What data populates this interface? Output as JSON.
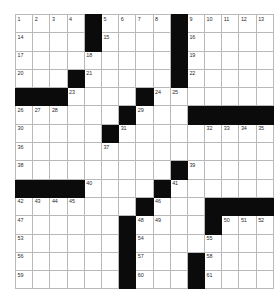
{
  "puzzle": {
    "title": "Crossword Grid",
    "rows": 15,
    "cols": 15,
    "colors": {
      "block": "#0b0b0b",
      "cell": "#ffffff",
      "grid_line": "#b9b9b9",
      "number": "#2a2a2a",
      "background": "#ffffff"
    },
    "grid": [
      [
        {
          "type": "cell",
          "number": "1"
        },
        {
          "type": "cell",
          "number": "2"
        },
        {
          "type": "cell",
          "number": "3"
        },
        {
          "type": "cell",
          "number": "4"
        },
        {
          "type": "block",
          "number": ""
        },
        {
          "type": "cell",
          "number": "5"
        },
        {
          "type": "cell",
          "number": "6"
        },
        {
          "type": "cell",
          "number": "7"
        },
        {
          "type": "cell",
          "number": "8"
        },
        {
          "type": "block",
          "number": ""
        },
        {
          "type": "cell",
          "number": "9"
        },
        {
          "type": "cell",
          "number": "10"
        },
        {
          "type": "cell",
          "number": "11"
        },
        {
          "type": "cell",
          "number": "12"
        },
        {
          "type": "cell",
          "number": "13"
        }
      ],
      [
        {
          "type": "cell",
          "number": "14"
        },
        {
          "type": "cell",
          "number": ""
        },
        {
          "type": "cell",
          "number": ""
        },
        {
          "type": "cell",
          "number": ""
        },
        {
          "type": "block",
          "number": ""
        },
        {
          "type": "cell",
          "number": "15"
        },
        {
          "type": "cell",
          "number": ""
        },
        {
          "type": "cell",
          "number": ""
        },
        {
          "type": "cell",
          "number": ""
        },
        {
          "type": "block",
          "number": ""
        },
        {
          "type": "cell",
          "number": "16"
        },
        {
          "type": "cell",
          "number": ""
        },
        {
          "type": "cell",
          "number": ""
        },
        {
          "type": "cell",
          "number": ""
        },
        {
          "type": "cell",
          "number": ""
        }
      ],
      [
        {
          "type": "cell",
          "number": "17"
        },
        {
          "type": "cell",
          "number": ""
        },
        {
          "type": "cell",
          "number": ""
        },
        {
          "type": "cell",
          "number": ""
        },
        {
          "type": "cell",
          "number": "18"
        },
        {
          "type": "cell",
          "number": ""
        },
        {
          "type": "cell",
          "number": ""
        },
        {
          "type": "cell",
          "number": ""
        },
        {
          "type": "cell",
          "number": ""
        },
        {
          "type": "block",
          "number": ""
        },
        {
          "type": "cell",
          "number": "19"
        },
        {
          "type": "cell",
          "number": ""
        },
        {
          "type": "cell",
          "number": ""
        },
        {
          "type": "cell",
          "number": ""
        },
        {
          "type": "cell",
          "number": ""
        }
      ],
      [
        {
          "type": "cell",
          "number": "20"
        },
        {
          "type": "cell",
          "number": ""
        },
        {
          "type": "cell",
          "number": ""
        },
        {
          "type": "block",
          "number": ""
        },
        {
          "type": "cell",
          "number": "21"
        },
        {
          "type": "cell",
          "number": ""
        },
        {
          "type": "cell",
          "number": ""
        },
        {
          "type": "cell",
          "number": ""
        },
        {
          "type": "cell",
          "number": ""
        },
        {
          "type": "block",
          "number": ""
        },
        {
          "type": "cell",
          "number": "22"
        },
        {
          "type": "cell",
          "number": ""
        },
        {
          "type": "cell",
          "number": ""
        },
        {
          "type": "cell",
          "number": ""
        },
        {
          "type": "cell",
          "number": ""
        }
      ],
      [
        {
          "type": "block",
          "number": ""
        },
        {
          "type": "block",
          "number": ""
        },
        {
          "type": "block",
          "number": ""
        },
        {
          "type": "cell",
          "number": "23"
        },
        {
          "type": "cell",
          "number": ""
        },
        {
          "type": "cell",
          "number": ""
        },
        {
          "type": "cell",
          "number": ""
        },
        {
          "type": "block",
          "number": ""
        },
        {
          "type": "cell",
          "number": "24"
        },
        {
          "type": "cell",
          "number": "25"
        },
        {
          "type": "cell",
          "number": ""
        },
        {
          "type": "cell",
          "number": ""
        },
        {
          "type": "cell",
          "number": ""
        },
        {
          "type": "cell",
          "number": ""
        },
        {
          "type": "cell",
          "number": ""
        }
      ],
      [
        {
          "type": "cell",
          "number": "26"
        },
        {
          "type": "cell",
          "number": "27"
        },
        {
          "type": "cell",
          "number": "28"
        },
        {
          "type": "cell",
          "number": ""
        },
        {
          "type": "cell",
          "number": ""
        },
        {
          "type": "cell",
          "number": ""
        },
        {
          "type": "block",
          "number": ""
        },
        {
          "type": "cell",
          "number": "29"
        },
        {
          "type": "cell",
          "number": ""
        },
        {
          "type": "cell",
          "number": ""
        },
        {
          "type": "block",
          "number": ""
        },
        {
          "type": "block",
          "number": ""
        },
        {
          "type": "block",
          "number": ""
        },
        {
          "type": "block",
          "number": ""
        },
        {
          "type": "block",
          "number": ""
        }
      ],
      [
        {
          "type": "cell",
          "number": "30"
        },
        {
          "type": "cell",
          "number": ""
        },
        {
          "type": "cell",
          "number": ""
        },
        {
          "type": "cell",
          "number": ""
        },
        {
          "type": "cell",
          "number": ""
        },
        {
          "type": "block",
          "number": ""
        },
        {
          "type": "cell",
          "number": "31"
        },
        {
          "type": "cell",
          "number": ""
        },
        {
          "type": "cell",
          "number": ""
        },
        {
          "type": "cell",
          "number": ""
        },
        {
          "type": "cell",
          "number": ""
        },
        {
          "type": "cell",
          "number": "32"
        },
        {
          "type": "cell",
          "number": "33"
        },
        {
          "type": "cell",
          "number": "34"
        },
        {
          "type": "cell",
          "number": "35"
        }
      ],
      [
        {
          "type": "cell",
          "number": "36"
        },
        {
          "type": "cell",
          "number": ""
        },
        {
          "type": "cell",
          "number": ""
        },
        {
          "type": "cell",
          "number": ""
        },
        {
          "type": "cell",
          "number": ""
        },
        {
          "type": "cell",
          "number": "37"
        },
        {
          "type": "cell",
          "number": ""
        },
        {
          "type": "cell",
          "number": ""
        },
        {
          "type": "cell",
          "number": ""
        },
        {
          "type": "cell",
          "number": ""
        },
        {
          "type": "cell",
          "number": ""
        },
        {
          "type": "cell",
          "number": ""
        },
        {
          "type": "cell",
          "number": ""
        },
        {
          "type": "cell",
          "number": ""
        },
        {
          "type": "cell",
          "number": ""
        }
      ],
      [
        {
          "type": "cell",
          "number": "38"
        },
        {
          "type": "cell",
          "number": ""
        },
        {
          "type": "cell",
          "number": ""
        },
        {
          "type": "cell",
          "number": ""
        },
        {
          "type": "cell",
          "number": ""
        },
        {
          "type": "cell",
          "number": ""
        },
        {
          "type": "cell",
          "number": ""
        },
        {
          "type": "cell",
          "number": ""
        },
        {
          "type": "cell",
          "number": ""
        },
        {
          "type": "block",
          "number": ""
        },
        {
          "type": "cell",
          "number": "39"
        },
        {
          "type": "cell",
          "number": ""
        },
        {
          "type": "cell",
          "number": ""
        },
        {
          "type": "cell",
          "number": ""
        },
        {
          "type": "cell",
          "number": ""
        }
      ],
      [
        {
          "type": "block",
          "number": ""
        },
        {
          "type": "block",
          "number": ""
        },
        {
          "type": "block",
          "number": ""
        },
        {
          "type": "block",
          "number": ""
        },
        {
          "type": "cell",
          "number": "40"
        },
        {
          "type": "cell",
          "number": ""
        },
        {
          "type": "cell",
          "number": ""
        },
        {
          "type": "cell",
          "number": ""
        },
        {
          "type": "block",
          "number": ""
        },
        {
          "type": "cell",
          "number": "41"
        },
        {
          "type": "cell",
          "number": ""
        },
        {
          "type": "cell",
          "number": ""
        },
        {
          "type": "cell",
          "number": ""
        },
        {
          "type": "cell",
          "number": ""
        },
        {
          "type": "cell",
          "number": ""
        }
      ],
      [
        {
          "type": "cell",
          "number": "42"
        },
        {
          "type": "cell",
          "number": "43"
        },
        {
          "type": "cell",
          "number": "44"
        },
        {
          "type": "cell",
          "number": "45"
        },
        {
          "type": "cell",
          "number": ""
        },
        {
          "type": "cell",
          "number": ""
        },
        {
          "type": "cell",
          "number": ""
        },
        {
          "type": "block",
          "number": ""
        },
        {
          "type": "cell",
          "number": "46"
        },
        {
          "type": "cell",
          "number": ""
        },
        {
          "type": "cell",
          "number": ""
        },
        {
          "type": "block",
          "number": ""
        },
        {
          "type": "block",
          "number": ""
        },
        {
          "type": "block",
          "number": ""
        },
        {
          "type": "block",
          "number": ""
        }
      ],
      [
        {
          "type": "cell",
          "number": "47"
        },
        {
          "type": "cell",
          "number": ""
        },
        {
          "type": "cell",
          "number": ""
        },
        {
          "type": "cell",
          "number": ""
        },
        {
          "type": "cell",
          "number": ""
        },
        {
          "type": "cell",
          "number": ""
        },
        {
          "type": "block",
          "number": ""
        },
        {
          "type": "cell",
          "number": "48"
        },
        {
          "type": "cell",
          "number": "49"
        },
        {
          "type": "cell",
          "number": ""
        },
        {
          "type": "cell",
          "number": ""
        },
        {
          "type": "block",
          "number": ""
        },
        {
          "type": "cell",
          "number": "50"
        },
        {
          "type": "cell",
          "number": "51"
        },
        {
          "type": "cell",
          "number": "52"
        }
      ],
      [
        {
          "type": "cell",
          "number": "53"
        },
        {
          "type": "cell",
          "number": ""
        },
        {
          "type": "cell",
          "number": ""
        },
        {
          "type": "cell",
          "number": ""
        },
        {
          "type": "cell",
          "number": ""
        },
        {
          "type": "cell",
          "number": ""
        },
        {
          "type": "block",
          "number": ""
        },
        {
          "type": "cell",
          "number": "54"
        },
        {
          "type": "cell",
          "number": ""
        },
        {
          "type": "cell",
          "number": ""
        },
        {
          "type": "cell",
          "number": ""
        },
        {
          "type": "cell",
          "number": "55"
        },
        {
          "type": "cell",
          "number": ""
        },
        {
          "type": "cell",
          "number": ""
        },
        {
          "type": "cell",
          "number": ""
        }
      ],
      [
        {
          "type": "cell",
          "number": "56"
        },
        {
          "type": "cell",
          "number": ""
        },
        {
          "type": "cell",
          "number": ""
        },
        {
          "type": "cell",
          "number": ""
        },
        {
          "type": "cell",
          "number": ""
        },
        {
          "type": "cell",
          "number": ""
        },
        {
          "type": "block",
          "number": ""
        },
        {
          "type": "cell",
          "number": "57"
        },
        {
          "type": "cell",
          "number": ""
        },
        {
          "type": "cell",
          "number": ""
        },
        {
          "type": "block",
          "number": ""
        },
        {
          "type": "cell",
          "number": "58"
        },
        {
          "type": "cell",
          "number": ""
        },
        {
          "type": "cell",
          "number": ""
        },
        {
          "type": "cell",
          "number": ""
        }
      ],
      [
        {
          "type": "cell",
          "number": "59"
        },
        {
          "type": "cell",
          "number": ""
        },
        {
          "type": "cell",
          "number": ""
        },
        {
          "type": "cell",
          "number": ""
        },
        {
          "type": "cell",
          "number": ""
        },
        {
          "type": "cell",
          "number": ""
        },
        {
          "type": "block",
          "number": ""
        },
        {
          "type": "cell",
          "number": "60"
        },
        {
          "type": "cell",
          "number": ""
        },
        {
          "type": "cell",
          "number": ""
        },
        {
          "type": "block",
          "number": ""
        },
        {
          "type": "cell",
          "number": "61"
        },
        {
          "type": "cell",
          "number": ""
        },
        {
          "type": "cell",
          "number": ""
        },
        {
          "type": "cell",
          "number": ""
        }
      ]
    ]
  }
}
